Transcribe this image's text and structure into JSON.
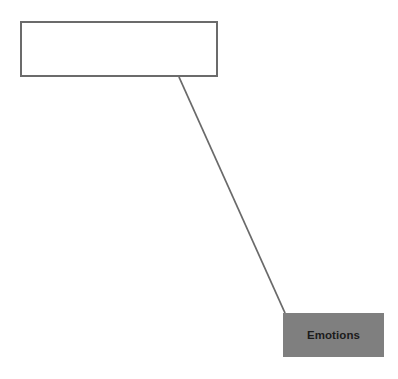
{
  "canvas": {
    "width": 398,
    "height": 379,
    "background_color": "#ffffff"
  },
  "diagram": {
    "type": "node-link",
    "nodes": [
      {
        "id": "empty-box",
        "label": "",
        "shape": "rectangle",
        "fill_color": "#ffffff",
        "border_color": "#6b6b6b",
        "border_width": 2,
        "text_color": "#1a1a1a",
        "x": 20,
        "y": 21,
        "width": 198,
        "height": 56
      },
      {
        "id": "emotions-box",
        "label": "Emotions",
        "shape": "rectangle",
        "fill_color": "#7f7f7f",
        "border_color": "#7f7f7f",
        "border_width": 0,
        "text_color": "#1b1b1b",
        "x": 283,
        "y": 313,
        "width": 101,
        "height": 44
      }
    ],
    "edges": [
      {
        "id": "empty-to-emotions",
        "from": "empty-box",
        "to": "emotions-box",
        "stroke_color": "#6a6a6a",
        "stroke_width": 1.8,
        "x1": 179,
        "y1": 77,
        "x2": 285,
        "y2": 313
      }
    ]
  }
}
